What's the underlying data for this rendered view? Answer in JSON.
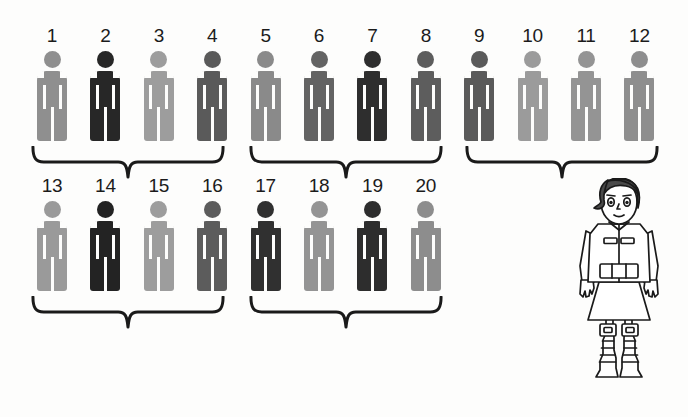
{
  "figure": {
    "title_cut_text": "",
    "background_color": "#fdfdfc",
    "total_people": 20,
    "icon_name": "person-pictogram-icon"
  },
  "shades": {
    "light": "#9a9a9a",
    "medium": "#7d7d7d",
    "dark": "#565656",
    "darker": "#3f3f3f",
    "black": "#262626"
  },
  "people": [
    {
      "number": "1",
      "row": 1,
      "shade": "#8f8f8f"
    },
    {
      "number": "2",
      "row": 1,
      "shade": "#272727"
    },
    {
      "number": "3",
      "row": 1,
      "shade": "#9d9d9d"
    },
    {
      "number": "4",
      "row": 1,
      "shade": "#5a5a5a"
    },
    {
      "number": "5",
      "row": 1,
      "shade": "#8a8a8a"
    },
    {
      "number": "6",
      "row": 1,
      "shade": "#636363"
    },
    {
      "number": "7",
      "row": 1,
      "shade": "#2e2e2e"
    },
    {
      "number": "8",
      "row": 1,
      "shade": "#5d5d5d"
    },
    {
      "number": "9",
      "row": 1,
      "shade": "#5a5a5a"
    },
    {
      "number": "10",
      "row": 1,
      "shade": "#9b9b9b"
    },
    {
      "number": "11",
      "row": 1,
      "shade": "#949494"
    },
    {
      "number": "12",
      "row": 1,
      "shade": "#8e8e8e"
    },
    {
      "number": "13",
      "row": 2,
      "shade": "#9a9a9a"
    },
    {
      "number": "14",
      "row": 2,
      "shade": "#232323"
    },
    {
      "number": "15",
      "row": 2,
      "shade": "#9d9d9d"
    },
    {
      "number": "16",
      "row": 2,
      "shade": "#5c5c5c"
    },
    {
      "number": "17",
      "row": 2,
      "shade": "#303030"
    },
    {
      "number": "18",
      "row": 2,
      "shade": "#949494"
    },
    {
      "number": "19",
      "row": 2,
      "shade": "#2d2d2d"
    },
    {
      "number": "20",
      "row": 2,
      "shade": "#8d8d8d"
    }
  ],
  "groups": [
    {
      "name": "group-1",
      "row": 1,
      "covers": "1-4",
      "label": ""
    },
    {
      "name": "group-2",
      "row": 1,
      "covers": "5-8",
      "label": ""
    },
    {
      "name": "group-3",
      "row": 1,
      "covers": "9-12",
      "label": ""
    },
    {
      "name": "group-4",
      "row": 2,
      "covers": "13-16",
      "label": ""
    },
    {
      "name": "group-5",
      "row": 2,
      "covers": "17-20",
      "label": ""
    }
  ],
  "character": {
    "name": "line-art-girl-illustration",
    "description": "Black and white line drawing of a girl with short dark hair, jacket with belt, skirt and armored boots",
    "hair_color": "#4a4a4a",
    "line_color": "#1a1a1a",
    "fill_color": "#ffffff"
  }
}
